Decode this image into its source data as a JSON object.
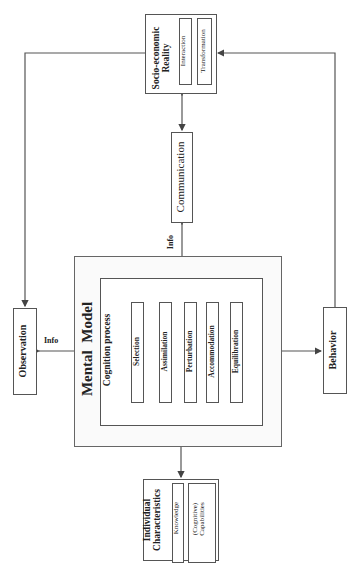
{
  "diagram": {
    "socio_economic": {
      "title_line1": "Socio-economic",
      "title_line2": "Reality",
      "items": [
        "Interaction",
        "Transformation"
      ]
    },
    "communication": "Communication",
    "info_top": "Info",
    "info_left": "Info",
    "mental_model": {
      "title_word1": "Mental",
      "title_word2": "Model",
      "cognition_title": "Cognition process",
      "steps": [
        "Selection",
        "Assimilation",
        "Perturbation",
        "Accommodation",
        "Equilibration"
      ]
    },
    "observation": "Observation",
    "behavior": "Behavior",
    "individual": {
      "title_line1": "Individual",
      "title_line2": "Characteristics",
      "knowledge": "Knowledge",
      "capabilities_line1": "(Cognitive)",
      "capabilities_line2": "Capabilities"
    },
    "colors": {
      "line": "#555555",
      "border": "#555555",
      "outer_fill": "#fafafa"
    }
  }
}
